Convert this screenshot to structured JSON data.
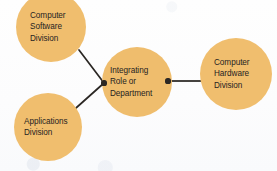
{
  "diagram": {
    "type": "node-link diagram",
    "background_color": "#fdfdfd",
    "node_fill_color": "#f0be6e",
    "connector_color": "#2b2724",
    "text_color": "#262322",
    "nodes": [
      {
        "id": "computer-software-division",
        "lines": [
          "Computer",
          "Software",
          "Division"
        ],
        "cx": 51,
        "cy": 27,
        "r": 35
      },
      {
        "id": "applications-division",
        "lines": [
          "Applications",
          "Division"
        ],
        "cx": 48,
        "cy": 127,
        "r": 34
      },
      {
        "id": "integrating-role-or-department",
        "lines": [
          "Integrating",
          "Role or",
          "Department"
        ],
        "cx": 137,
        "cy": 82,
        "r": 35
      },
      {
        "id": "computer-hardware-division",
        "lines": [
          "Computer",
          "Hardware",
          "Division"
        ],
        "cx": 236,
        "cy": 74,
        "r": 36
      }
    ],
    "connectors": [
      {
        "id": "software-to-integrating",
        "from": "computer-software-division",
        "to": "integrating-role-or-department",
        "style": "diagonal-line"
      },
      {
        "id": "applications-to-integrating",
        "from": "applications-division",
        "to": "integrating-role-or-department",
        "style": "diagonal-line"
      },
      {
        "id": "integrating-to-hardware",
        "from": "integrating-role-or-department",
        "to": "computer-hardware-division",
        "style": "horizontal-line"
      }
    ],
    "junction_dots": [
      {
        "id": "left-junction-dot",
        "cx": 104,
        "cy": 83,
        "r": 2.6
      },
      {
        "id": "right-junction-dot",
        "cx": 168,
        "cy": 81,
        "r": 2.6
      }
    ]
  }
}
